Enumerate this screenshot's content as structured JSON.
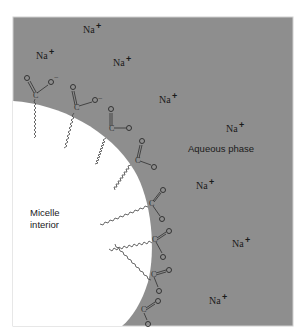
{
  "diagram": {
    "colors": {
      "aqueous_phase": "#8e8e8e",
      "micelle_interior": "#ffffff",
      "frame_border": "#d0d0d0",
      "text": "#1a1a1a"
    },
    "regions": {
      "aqueous_label": "Aqueous phase",
      "micelle_label_line1": "Micelle",
      "micelle_label_line2": "interior"
    },
    "counterions": {
      "symbol": "Na",
      "charge": "+",
      "count": 9,
      "positions": [
        {
          "x": 83,
          "y": 33
        },
        {
          "x": 36,
          "y": 56
        },
        {
          "x": 113,
          "y": 64
        },
        {
          "x": 159,
          "y": 100
        },
        {
          "x": 254,
          "y": 128
        },
        {
          "x": 196,
          "y": 186
        },
        {
          "x": 233,
          "y": 243
        },
        {
          "x": 209,
          "y": 302
        }
      ]
    },
    "head_group": {
      "carbon": "C",
      "oxygen": "O",
      "charge": "−",
      "count": 8
    }
  }
}
